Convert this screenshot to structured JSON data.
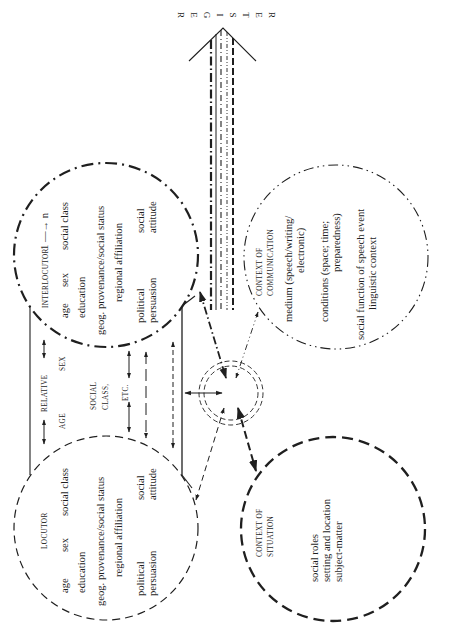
{
  "register": {
    "letters": [
      "R",
      "E",
      "G",
      "I",
      "S",
      "T",
      "E",
      "R"
    ]
  },
  "interlocutor": {
    "title": "INTERLOCUTOR",
    "range": "1 —→ n",
    "col1": [
      "age",
      "sex",
      "social class"
    ],
    "col2": [
      "education"
    ],
    "col3": [
      "geog. provenance/social status"
    ],
    "col4": [
      "regional affiliation"
    ],
    "col5a": [
      "political",
      "social"
    ],
    "col5b": [
      "persuasion",
      "attitude"
    ]
  },
  "locutor": {
    "title": "LOCUTOR",
    "col1": [
      "age",
      "sex",
      "social class"
    ],
    "col2": [
      "education"
    ],
    "col3": [
      "geog. provenance/social status"
    ],
    "col4": [
      "regional affiliation"
    ],
    "col5a": [
      "political",
      "social"
    ],
    "col5b": [
      "persuasion",
      "attitude"
    ]
  },
  "relative": {
    "title": "RELATIVE",
    "age": "AGE",
    "sex": "SEX",
    "social_class_1": "SOCIAL",
    "social_class_2": "CLASS,",
    "etc": "ETC."
  },
  "context_communication": {
    "title_1": "CONTEXT OF",
    "title_2": "COMMUNICATION",
    "lines": [
      "medium (speech/writing/",
      "electronic)",
      "conditions (space; time;",
      "preparedness)",
      "social function of speech event",
      "linguistic context"
    ]
  },
  "context_situation": {
    "title_1": "CONTEXT OF",
    "title_2": "SITUATION",
    "lines": [
      "social roles",
      "setting and location",
      "subject-matter"
    ]
  },
  "colors": {
    "ink": "#1f1f1f",
    "background": "#ffffff"
  }
}
